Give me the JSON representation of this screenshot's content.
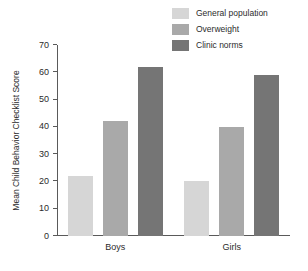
{
  "chart_data": {
    "type": "bar",
    "title": "",
    "subtitle": "",
    "xlabel": "",
    "ylabel": "Mean Child Behavior Checklist Score",
    "categories": [
      "Boys",
      "Girls"
    ],
    "series": [
      {
        "name": "General population",
        "color": "#d6d6d6",
        "values": [
          22,
          20
        ]
      },
      {
        "name": "Overweight",
        "color": "#a9a9a9",
        "values": [
          42,
          40
        ]
      },
      {
        "name": "Clinic norms",
        "color": "#757575",
        "values": [
          62,
          59
        ]
      }
    ],
    "ylim": [
      0,
      70
    ],
    "yticks": [
      0,
      10,
      20,
      30,
      40,
      50,
      60,
      70
    ],
    "ytick_labels": [
      "0",
      "10",
      "20",
      "30",
      "40",
      "50",
      "60",
      "70"
    ],
    "grid": false,
    "legend_position": "top-right",
    "axis_color": "#5a5a5a",
    "text_color": "#2b2b2b",
    "background": "#ffffff"
  }
}
